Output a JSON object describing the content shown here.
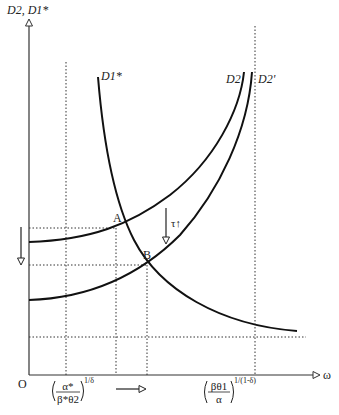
{
  "diagram": {
    "y_axis_label": "D2, D1*",
    "x_axis_label": "ω",
    "origin_label": "O",
    "curves": [
      {
        "id": "D1star",
        "label": "D1*",
        "shape": "decreasing convex"
      },
      {
        "id": "D2",
        "label": "D2",
        "shape": "increasing convex (upper)"
      },
      {
        "id": "D2prime",
        "label": "D2'",
        "shape": "increasing convex (lower, shifted)"
      }
    ],
    "points": [
      {
        "label": "A",
        "desc": "intersection of D1* and D2"
      },
      {
        "label": "B",
        "desc": "intersection of D1* and D2'"
      }
    ],
    "shift_annotation": "τ↑",
    "x_tick_left": {
      "numerator": "α*",
      "denominator": "β*θ2",
      "exponent": "1/δ"
    },
    "x_tick_right": {
      "numerator": "βθ1",
      "denominator": "α",
      "exponent": "1/(1-δ)"
    },
    "arrows": [
      {
        "direction": "down",
        "location": "left of y-axis"
      },
      {
        "direction": "right",
        "location": "below x-axis"
      },
      {
        "direction": "down",
        "location": "between D2 and D2', labelled τ↑"
      }
    ],
    "colors": {
      "line": "#111111",
      "dotted": "#333333",
      "background": "#ffffff"
    }
  }
}
